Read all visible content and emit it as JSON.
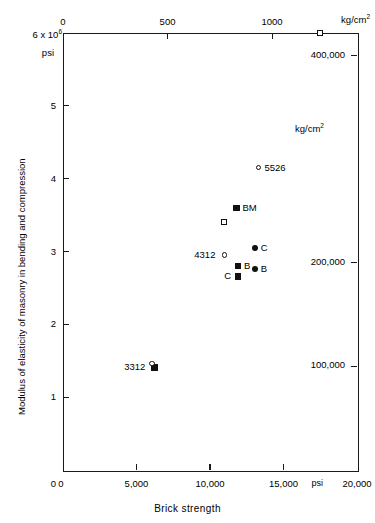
{
  "chart_data": {
    "type": "scatter",
    "title": "",
    "xlabel": "Brick strength",
    "ylabel": "Modulus of elasticity of masonry in bending and compression",
    "x_axis": {
      "unit_bottom": "psi",
      "unit_top": "kg/cm2",
      "ticks_bottom": [
        "0",
        "5,000",
        "10,000",
        "15,000",
        "20,000"
      ],
      "tick_values_bottom": [
        0,
        5000,
        10000,
        15000,
        20000
      ],
      "psi_marker_label": "psi",
      "ticks_top": [
        "0",
        "500",
        "1000"
      ],
      "tick_values_top": [
        0,
        500,
        1000
      ],
      "top_unit_label": "kg/cm",
      "top_unit_exponent": "2",
      "xlim": [
        0,
        20000
      ]
    },
    "y_axis": {
      "top_label_prefix": "6 x 10",
      "top_label_exponent": "6",
      "top_label_unit": "psi",
      "ticks_left": [
        "5",
        "4",
        "3",
        "2",
        "1"
      ],
      "tick_values_left": [
        5,
        4,
        3,
        2,
        1
      ],
      "ticks_right": [
        "400,000",
        "200,000",
        "100,000"
      ],
      "tick_values_right": [
        400000,
        200000,
        100000
      ],
      "right_unit_label": "kg/cm",
      "right_unit_exponent": "2",
      "ylim": [
        0,
        6
      ]
    },
    "points": [
      {
        "id": "top-open-square",
        "x": 17500,
        "y": 6.0,
        "marker": "open-square",
        "label": ""
      },
      {
        "id": "5526",
        "x": 13300,
        "y": 4.15,
        "marker": "open-circle",
        "label": "5526",
        "label_pos": "right"
      },
      {
        "id": "BM",
        "x": 11800,
        "y": 3.6,
        "marker": "filled-square",
        "label": "BM",
        "label_pos": "right"
      },
      {
        "id": "open-square-mid",
        "x": 10950,
        "y": 3.4,
        "marker": "open-square",
        "label": ""
      },
      {
        "id": "C-circle",
        "x": 13050,
        "y": 3.05,
        "marker": "filled-circle",
        "label": "C",
        "label_pos": "right"
      },
      {
        "id": "4312",
        "x": 11000,
        "y": 2.95,
        "marker": "open-circle",
        "label": "4312",
        "label_pos": "left"
      },
      {
        "id": "B-circle",
        "x": 13050,
        "y": 2.76,
        "marker": "filled-circle",
        "label": "B",
        "label_pos": "right"
      },
      {
        "id": "B-square",
        "x": 11900,
        "y": 2.8,
        "marker": "filled-square",
        "label": "B",
        "label_pos": "right"
      },
      {
        "id": "C-square",
        "x": 11900,
        "y": 2.66,
        "marker": "filled-square",
        "label": "C",
        "label_pos": "left"
      },
      {
        "id": "3312",
        "x": 6230,
        "y": 1.42,
        "marker": "square-circle",
        "label": "3312",
        "label_pos": "left"
      }
    ],
    "grid": false,
    "legend": "none"
  }
}
